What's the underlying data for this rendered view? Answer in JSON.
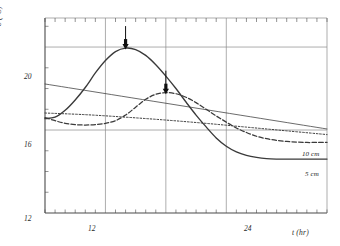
{
  "chart_data": {
    "type": "line",
    "title": "",
    "xlabel": "t (hr)",
    "ylabel": "ϑ (°C)",
    "xlim": [
      6,
      34
    ],
    "ylim": [
      12,
      21.4
    ],
    "xticks": [
      12,
      24
    ],
    "xtick_labels": [
      "12",
      "24"
    ],
    "yticks": [
      12,
      16,
      20
    ],
    "ytick_labels": [
      "12",
      "16",
      "20"
    ],
    "gridlines_y": [
      16,
      20
    ],
    "gridlines_x": [
      12,
      18,
      24
    ],
    "grid": true,
    "legend_position": "inline-right",
    "series": [
      {
        "name": "5 cm",
        "style": "solid",
        "label": "5 cm",
        "x": [
          6.0,
          7.0,
          8.0,
          9.0,
          10.0,
          11.0,
          12.0,
          13.0,
          14.0,
          15.0,
          16.0,
          17.0,
          18.0,
          19.0,
          20.0,
          21.0,
          22.0,
          23.0,
          24.0,
          25.0,
          26.0,
          27.0,
          28.0,
          29.0,
          30.0,
          31.0,
          32.0,
          33.0,
          34.0
        ],
        "y": [
          16.55,
          16.62,
          16.95,
          17.45,
          18.05,
          18.75,
          19.35,
          19.78,
          19.95,
          19.88,
          19.6,
          19.15,
          18.6,
          18.0,
          17.35,
          16.72,
          16.15,
          15.62,
          15.22,
          14.95,
          14.78,
          14.68,
          14.62,
          14.6,
          14.6,
          14.6,
          14.6,
          14.6,
          14.6
        ]
      },
      {
        "name": "10 cm",
        "style": "dashed",
        "label": "10 cm",
        "x": [
          6.0,
          7.0,
          8.0,
          9.0,
          10.0,
          11.0,
          12.0,
          13.0,
          14.0,
          15.0,
          16.0,
          17.0,
          18.0,
          19.0,
          20.0,
          21.0,
          22.0,
          23.0,
          24.0,
          25.0,
          26.0,
          27.0,
          28.0,
          29.0,
          30.0,
          31.0,
          32.0,
          33.0,
          34.0
        ],
        "y": [
          16.6,
          16.45,
          16.32,
          16.26,
          16.24,
          16.26,
          16.32,
          16.45,
          16.72,
          17.1,
          17.48,
          17.72,
          17.8,
          17.75,
          17.58,
          17.32,
          17.0,
          16.68,
          16.38,
          16.1,
          15.88,
          15.7,
          15.58,
          15.5,
          15.45,
          15.42,
          15.4,
          15.4,
          15.4
        ]
      },
      {
        "name": "reference-dotted",
        "style": "dotted",
        "label": "",
        "x": [
          6.0,
          10.0,
          14.0,
          18.0,
          22.0,
          26.0,
          30.0,
          34.0
        ],
        "y": [
          16.82,
          16.74,
          16.62,
          16.48,
          16.32,
          16.14,
          15.96,
          15.78
        ]
      },
      {
        "name": "reference-straight",
        "style": "thin-solid",
        "label": "",
        "x": [
          6.0,
          34.0
        ],
        "y": [
          18.22,
          16.05
        ]
      }
    ],
    "annotations": [
      {
        "name": "peak-arrow-5cm",
        "x": 14.0,
        "y": 19.95,
        "symbol": "down-arrow"
      },
      {
        "name": "peak-arrow-10cm",
        "x": 18.0,
        "y": 17.8,
        "symbol": "down-arrow"
      }
    ]
  },
  "axes": {
    "y_title": "ϑ (°C)",
    "x_title": "t (hr)",
    "y_tick_20": "20",
    "y_tick_16": "16",
    "y_tick_12": "12",
    "x_tick_12": "12",
    "x_tick_24": "24"
  },
  "curve_labels": {
    "depth_10cm": "10 cm",
    "depth_5cm": "5 cm"
  },
  "colors": {
    "line": "#3a3a3a",
    "axis": "#4a4a4a",
    "grid": "#8a8a8a",
    "background": "#ffffff",
    "arrow": "#101010"
  }
}
